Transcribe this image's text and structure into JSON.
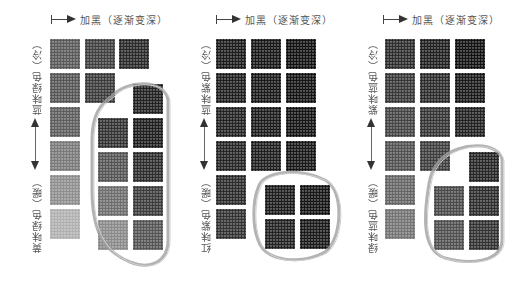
{
  "panels": [
    {
      "id": "green",
      "top_label": "加黑（逐渐变深）",
      "side_label_cool": "蓝味绿色（冷）",
      "side_label_warm": "黄味绿色（暖）",
      "swatches": [
        {
          "x": 50,
          "y": 39,
          "c": "#5a5a5a"
        },
        {
          "x": 50,
          "y": 73,
          "c": "#565656"
        },
        {
          "x": 50,
          "y": 107,
          "c": "#5e5e5e"
        },
        {
          "x": 50,
          "y": 141,
          "c": "#7a7a7a"
        },
        {
          "x": 50,
          "y": 175,
          "c": "#8f8f8f"
        },
        {
          "x": 50,
          "y": 209,
          "c": "#b0b0b0"
        },
        {
          "x": 85,
          "y": 39,
          "c": "#404040"
        },
        {
          "x": 85,
          "y": 73,
          "c": "#3b3b3b"
        },
        {
          "x": 119,
          "y": 39,
          "c": "#2a2a2a"
        },
        {
          "x": 133,
          "y": 84,
          "c": "#222222"
        },
        {
          "x": 133,
          "y": 118,
          "c": "#1e1e1e"
        },
        {
          "x": 133,
          "y": 152,
          "c": "#2d2d2d"
        },
        {
          "x": 133,
          "y": 186,
          "c": "#3c3c3c"
        },
        {
          "x": 133,
          "y": 220,
          "c": "#555555"
        },
        {
          "x": 98,
          "y": 118,
          "c": "#333333"
        },
        {
          "x": 98,
          "y": 152,
          "c": "#555555"
        },
        {
          "x": 98,
          "y": 186,
          "c": "#6e6e6e"
        },
        {
          "x": 98,
          "y": 220,
          "c": "#8a8a8a"
        }
      ],
      "loop": "M 112 96 C 125 80, 165 78, 168 100 L 168 240 C 168 262, 150 270, 130 262 C 100 250, 92 225, 92 190 L 92 140 C 92 115, 100 104, 112 96 Z"
    },
    {
      "id": "purple",
      "top_label": "加黑（逐渐变深）",
      "side_label_cool": "蓝味紫色（冷）",
      "side_label_warm": "红味紫色（暖）",
      "swatches": [
        {
          "x": 216,
          "y": 39,
          "c": "#1c1c1c"
        },
        {
          "x": 216,
          "y": 73,
          "c": "#1f1f1f"
        },
        {
          "x": 216,
          "y": 107,
          "c": "#232323"
        },
        {
          "x": 216,
          "y": 141,
          "c": "#262626"
        },
        {
          "x": 216,
          "y": 175,
          "c": "#2c2c2c"
        },
        {
          "x": 216,
          "y": 209,
          "c": "#333333"
        },
        {
          "x": 251,
          "y": 39,
          "c": "#181818"
        },
        {
          "x": 251,
          "y": 73,
          "c": "#1a1a1a"
        },
        {
          "x": 251,
          "y": 107,
          "c": "#1c1c1c"
        },
        {
          "x": 251,
          "y": 141,
          "c": "#1f1f1f"
        },
        {
          "x": 286,
          "y": 39,
          "c": "#121212"
        },
        {
          "x": 286,
          "y": 73,
          "c": "#141414"
        },
        {
          "x": 286,
          "y": 107,
          "c": "#151515"
        },
        {
          "x": 286,
          "y": 141,
          "c": "#181818"
        },
        {
          "x": 265,
          "y": 185,
          "c": "#1d1d1d"
        },
        {
          "x": 300,
          "y": 185,
          "c": "#161616"
        },
        {
          "x": 265,
          "y": 219,
          "c": "#232323"
        },
        {
          "x": 300,
          "y": 219,
          "c": "#1a1a1a"
        }
      ],
      "loop": "M 258 188 C 262 170, 300 168, 325 180 C 345 190, 342 240, 325 252 C 300 265, 265 262, 258 240 C 252 225, 253 200, 258 188 Z"
    },
    {
      "id": "blue",
      "top_label": "加黑（逐渐变深）",
      "side_label_cool": "紫味蓝色（冷）",
      "side_label_warm": "绿味蓝色（暖）",
      "swatches": [
        {
          "x": 385,
          "y": 39,
          "c": "#2d2d2d"
        },
        {
          "x": 385,
          "y": 73,
          "c": "#383838"
        },
        {
          "x": 385,
          "y": 107,
          "c": "#454545"
        },
        {
          "x": 385,
          "y": 141,
          "c": "#525252"
        },
        {
          "x": 385,
          "y": 175,
          "c": "#666666"
        },
        {
          "x": 385,
          "y": 209,
          "c": "#747474"
        },
        {
          "x": 420,
          "y": 39,
          "c": "#202020"
        },
        {
          "x": 420,
          "y": 73,
          "c": "#2c2c2c"
        },
        {
          "x": 420,
          "y": 107,
          "c": "#353535"
        },
        {
          "x": 420,
          "y": 141,
          "c": "#3e3e3e"
        },
        {
          "x": 455,
          "y": 39,
          "c": "#121212"
        },
        {
          "x": 455,
          "y": 73,
          "c": "#1a1a1a"
        },
        {
          "x": 455,
          "y": 107,
          "c": "#222222"
        },
        {
          "x": 469,
          "y": 152,
          "c": "#262626"
        },
        {
          "x": 469,
          "y": 186,
          "c": "#2e2e2e"
        },
        {
          "x": 469,
          "y": 220,
          "c": "#333333"
        },
        {
          "x": 434,
          "y": 186,
          "c": "#4a4a4a"
        },
        {
          "x": 434,
          "y": 220,
          "c": "#505050"
        }
      ],
      "loop": "M 440 160 C 460 140, 500 142, 502 160 L 502 240 C 502 262, 470 265, 445 258 C 420 250, 425 210, 428 190 C 430 175, 433 168, 440 160 Z"
    }
  ],
  "colors": {
    "background": "#ffffff",
    "label_text": "#555555",
    "arrow": "#333333",
    "loop_stroke": "#9a9a9a"
  }
}
